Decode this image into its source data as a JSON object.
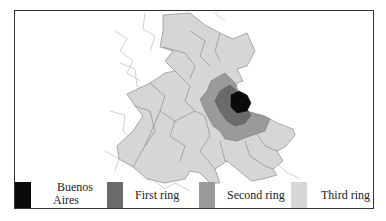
{
  "map": {
    "title": "",
    "legend": [
      {
        "label_line1": "Buenos",
        "label_line2": "Aires",
        "color": "#0a0a0a"
      },
      {
        "label": "First ring",
        "color": "#6b6b6b"
      },
      {
        "label": "Second ring",
        "color": "#9a9a9a"
      },
      {
        "label": "Third ring",
        "color": "#d6d6d6"
      }
    ],
    "colors": {
      "buenos_aires": "#0a0a0a",
      "first_ring": "#6b6b6b",
      "second_ring": "#9a9a9a",
      "third_ring": "#d6d6d6",
      "outline": "#8c8c8c",
      "outside_lines": "#bdbdbd"
    }
  }
}
